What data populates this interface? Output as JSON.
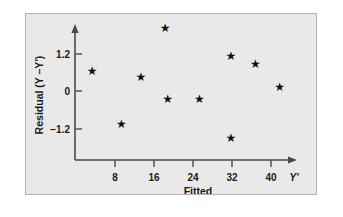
{
  "figure": {
    "background_color": "#e9e9e9",
    "border_color": "#b4b4b4",
    "axis_color": "#4a4a4a",
    "marker_color": "#101010",
    "marker_glyph": "★"
  },
  "chart_data": {
    "type": "scatter",
    "title": "",
    "xlabel": "Fitted",
    "ylabel": "Residual (Y –Y')",
    "x_end_label": "Y'",
    "xticks": [
      8,
      16,
      24,
      32,
      40
    ],
    "xtick_labels": [
      "8",
      "16",
      "24",
      "32",
      "40"
    ],
    "yticks": [
      1.2,
      0,
      -1.2
    ],
    "ytick_labels": [
      "1.2",
      "0",
      "−1.2"
    ],
    "xlim": [
      0,
      44
    ],
    "ylim": [
      -2.1,
      2.3
    ],
    "grid": false,
    "legend": null,
    "x": [
      3.5,
      9.5,
      13.5,
      18.5,
      19.0,
      25.5,
      32.0,
      32.0,
      37.0,
      42.0
    ],
    "y": [
      0.65,
      -1.05,
      0.45,
      2.05,
      -0.25,
      -0.25,
      1.15,
      -1.5,
      0.9,
      0.15
    ],
    "points": [
      {
        "x": 3.5,
        "y": 0.65
      },
      {
        "x": 9.5,
        "y": -1.05
      },
      {
        "x": 13.5,
        "y": 0.45
      },
      {
        "x": 18.5,
        "y": 2.05
      },
      {
        "x": 19.0,
        "y": -0.25
      },
      {
        "x": 25.5,
        "y": -0.25
      },
      {
        "x": 32.0,
        "y": 1.15
      },
      {
        "x": 32.0,
        "y": -1.5
      },
      {
        "x": 37.0,
        "y": 0.9
      },
      {
        "x": 42.0,
        "y": 0.15
      }
    ]
  }
}
